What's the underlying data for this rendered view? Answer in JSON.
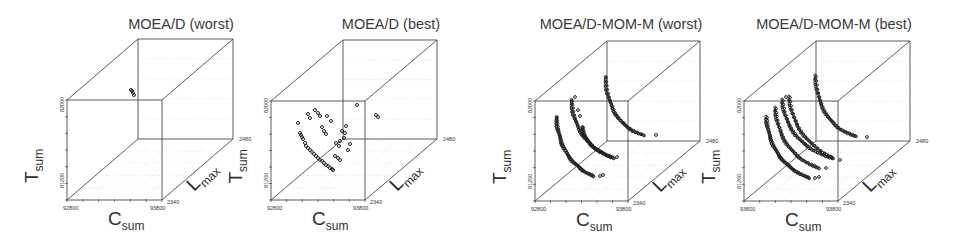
{
  "figure": {
    "panels": [
      {
        "id": "moead-worst",
        "title": "MOEA/D (worst)",
        "title_pos": [
          181,
          29
        ],
        "front": [
          67,
          100,
          162,
          200
        ],
        "back_offset": [
          71,
          -61
        ],
        "axis_labels": {
          "z_main": "T",
          "z_sub": "sum",
          "x_main": "C",
          "x_sub": "sum",
          "y_main": "L",
          "y_sub": "max"
        },
        "ticks": {
          "x_min": "92800",
          "x_max": "93800",
          "y_min": "2340",
          "y_max": "2480",
          "z_min": "81200",
          "z_max": "82000"
        },
        "points": [
          [
            131,
            90
          ],
          [
            132,
            91
          ],
          [
            133,
            93
          ],
          [
            134,
            95
          ]
        ]
      },
      {
        "id": "moead-best",
        "title": "MOEA/D (best)",
        "title_pos": [
          391,
          29
        ],
        "front": [
          271,
          101,
          365,
          200
        ],
        "back_offset": [
          72,
          -61
        ],
        "axis_labels": {
          "z_main": "T",
          "z_sub": "sum",
          "x_main": "C",
          "x_sub": "sum",
          "y_main": "L",
          "y_sub": "max"
        },
        "ticks": {
          "x_min": "92800",
          "x_max": "93800",
          "y_min": "2340",
          "y_max": "2480",
          "z_min": "81200",
          "z_max": "82000"
        },
        "points": [
          [
            300,
            133
          ],
          [
            301,
            135
          ],
          [
            302,
            137
          ],
          [
            303,
            139
          ],
          [
            305,
            143
          ],
          [
            306,
            146
          ],
          [
            308,
            148
          ],
          [
            310,
            150
          ],
          [
            312,
            152
          ],
          [
            314,
            154
          ],
          [
            316,
            156
          ],
          [
            318,
            158
          ],
          [
            320,
            160
          ],
          [
            322,
            161
          ],
          [
            324,
            163
          ],
          [
            326,
            165
          ],
          [
            328,
            166
          ],
          [
            330,
            168
          ],
          [
            332,
            169
          ],
          [
            333,
            170
          ],
          [
            315,
            110
          ],
          [
            318,
            113
          ],
          [
            320,
            116
          ],
          [
            308,
            114
          ],
          [
            310,
            118
          ],
          [
            298,
            123
          ],
          [
            327,
            116
          ],
          [
            322,
            127
          ],
          [
            324,
            131
          ],
          [
            326,
            134
          ],
          [
            345,
            133
          ],
          [
            342,
            131
          ],
          [
            346,
            126
          ],
          [
            344,
            138
          ],
          [
            340,
            141
          ],
          [
            348,
            150
          ],
          [
            335,
            156
          ],
          [
            338,
            158
          ],
          [
            340,
            160
          ],
          [
            331,
            121
          ],
          [
            357,
            105
          ],
          [
            376,
            115
          ],
          [
            378,
            117
          ],
          [
            336,
            143
          ],
          [
            339,
            146
          ],
          [
            350,
            144
          ]
        ]
      },
      {
        "id": "moead-mom-m-worst",
        "title": "MOEA/D-MOM-M (worst)",
        "title_pos": [
          621,
          29
        ],
        "front": [
          535,
          101,
          628,
          201
        ],
        "back_offset": [
          72,
          -60
        ],
        "axis_labels": {
          "z_main": "T",
          "z_sub": "sum",
          "x_main": "C",
          "x_sub": "sum",
          "y_main": "L",
          "y_sub": "max"
        },
        "ticks": {
          "x_min": "92800",
          "x_max": "93800",
          "y_min": "2340",
          "y_max": "2480",
          "z_min": "81200",
          "z_max": "82000"
        },
        "curves": [
          {
            "from": [
              556,
              117
            ],
            "to": [
              593,
              176
            ],
            "bend": 0.55,
            "n": 60,
            "extra": [
              [
                600,
                176
              ],
              [
                603,
                175
              ]
            ]
          },
          {
            "from": [
              571,
              100
            ],
            "to": [
              611,
              157
            ],
            "bend": 0.55,
            "n": 45,
            "extra": [
              [
                617,
                157
              ],
              [
                575,
                97
              ]
            ]
          },
          {
            "from": [
              582,
              127
            ],
            "to": [
              614,
              158
            ],
            "bend": 0.5,
            "n": 40,
            "extra": [
              [
                578,
                110
              ],
              [
                580,
                116
              ]
            ]
          },
          {
            "from": [
              605,
              77
            ],
            "to": [
              643,
              135
            ],
            "bend": 0.6,
            "n": 45,
            "extra": [
              [
                656,
                135
              ]
            ]
          }
        ]
      },
      {
        "id": "moead-mom-m-best",
        "title": "MOEA/D-MOM-M (best)",
        "title_pos": [
          834,
          29
        ],
        "front": [
          744,
          101,
          838,
          201
        ],
        "back_offset": [
          72,
          -60
        ],
        "axis_labels": {
          "z_main": "T",
          "z_sub": "sum",
          "x_main": "C",
          "x_sub": "sum",
          "y_main": "L",
          "y_sub": "max"
        },
        "ticks": {
          "x_min": "93800",
          "x_max": "93800",
          "y_min": "2340",
          "y_max": "2480",
          "z_min": "81200",
          "z_max": "82000"
        },
        "curves": [
          {
            "from": [
              766,
              117
            ],
            "to": [
              809,
              178
            ],
            "bend": 0.55,
            "n": 60,
            "extra": [
              [
                815,
                178
              ],
              [
                819,
                177
              ]
            ]
          },
          {
            "from": [
              775,
              108
            ],
            "to": [
              818,
              168
            ],
            "bend": 0.55,
            "n": 45,
            "extra": [
              [
                826,
                168
              ]
            ]
          },
          {
            "from": [
              782,
              100
            ],
            "to": [
              831,
              158
            ],
            "bend": 0.55,
            "n": 45,
            "extra": [
              [
                786,
                97
              ]
            ]
          },
          {
            "from": [
              789,
              97
            ],
            "to": [
              833,
              158
            ],
            "bend": 0.5,
            "n": 40,
            "extra": [
              [
                840,
                160
              ]
            ]
          },
          {
            "from": [
              815,
              76
            ],
            "to": [
              855,
              136
            ],
            "bend": 0.6,
            "n": 45,
            "extra": [
              [
                867,
                137
              ]
            ]
          }
        ]
      }
    ]
  },
  "chart_data": [
    {
      "type": "scatter",
      "projection": "3d",
      "title": "MOEA/D (worst)",
      "xlabel": "C_sum",
      "ylabel": "L_max",
      "zlabel": "T_sum",
      "xlim": [
        92800,
        93800
      ],
      "ylim": [
        2340,
        2480
      ],
      "zlim": [
        81200,
        82000
      ],
      "x_ticks": [
        "92800",
        "93800"
      ],
      "y_ticks": [
        "2340",
        "2480"
      ],
      "z_ticks": [
        "81200",
        "82000"
      ],
      "grid": true,
      "legend": null,
      "description": "Very few points; a tiny cluster near the top back of the cube"
    },
    {
      "type": "scatter",
      "projection": "3d",
      "title": "MOEA/D (best)",
      "xlabel": "C_sum",
      "ylabel": "L_max",
      "zlabel": "T_sum",
      "xlim": [
        92800,
        93800
      ],
      "ylim": [
        2340,
        2480
      ],
      "zlim": [
        81200,
        82000
      ],
      "x_ticks": [
        "92800",
        "93800"
      ],
      "y_ticks": [
        "2340",
        "2480"
      ],
      "z_ticks": [
        "81200",
        "82000"
      ],
      "grid": true,
      "legend": null,
      "description": "Sparse scattered points forming a diagonal band; few distinct front curves"
    },
    {
      "type": "scatter",
      "projection": "3d",
      "title": "MOEA/D-MOM-M (worst)",
      "xlabel": "C_sum",
      "ylabel": "L_max",
      "zlabel": "T_sum",
      "xlim": [
        92800,
        93800
      ],
      "ylim": [
        2340,
        2480
      ],
      "zlim": [
        81200,
        82000
      ],
      "x_ticks": [
        "92800",
        "93800"
      ],
      "y_ticks": [
        "2340",
        "2480"
      ],
      "z_ticks": [
        "81200",
        "82000"
      ],
      "grid": true,
      "legend": null,
      "description": "Four dense convex Pareto-front curves at different L_max levels"
    },
    {
      "type": "scatter",
      "projection": "3d",
      "title": "MOEA/D-MOM-M (best)",
      "xlabel": "C_sum",
      "ylabel": "L_max",
      "zlabel": "T_sum",
      "xlim": [
        92800,
        93800
      ],
      "ylim": [
        2340,
        2480
      ],
      "zlim": [
        81200,
        82000
      ],
      "x_ticks": [
        "93800",
        "93800"
      ],
      "y_ticks": [
        "2340",
        "2480"
      ],
      "z_ticks": [
        "81200",
        "82000"
      ],
      "grid": true,
      "legend": null,
      "description": "Five dense convex Pareto-front curves at different L_max levels"
    }
  ]
}
